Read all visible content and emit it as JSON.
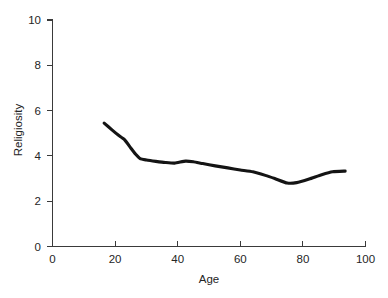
{
  "chart_data": {
    "type": "line",
    "title": "",
    "xlabel": "Age",
    "ylabel": "Religiosity",
    "xlim": [
      0,
      100
    ],
    "ylim": [
      0,
      10
    ],
    "xticks": [
      0,
      20,
      40,
      60,
      80,
      100
    ],
    "yticks": [
      0,
      2,
      4,
      6,
      8,
      10
    ],
    "xtick_labels": [
      "0",
      "20",
      "40",
      "60",
      "80",
      "100"
    ],
    "ytick_labels": [
      "0",
      "2",
      "4",
      "6",
      "8",
      "10"
    ],
    "grid": false,
    "legend": null,
    "series": [
      {
        "name": "Religiosity by age",
        "color": "#141414",
        "line_width": 3.1,
        "x": [
          16.5,
          19,
          21,
          23,
          25,
          26.5,
          28,
          30,
          33,
          36,
          39,
          42.5,
          45,
          48,
          52,
          56,
          60,
          64,
          68,
          71,
          75,
          78,
          82,
          86,
          89.5,
          93.5
        ],
        "y": [
          5.45,
          5.15,
          4.92,
          4.72,
          4.35,
          4.08,
          3.88,
          3.82,
          3.76,
          3.71,
          3.68,
          3.77,
          3.74,
          3.66,
          3.56,
          3.47,
          3.38,
          3.3,
          3.14,
          3.0,
          2.8,
          2.82,
          2.98,
          3.17,
          3.3,
          3.33
        ]
      }
    ]
  },
  "axes": {
    "x_axis_name": "Age",
    "y_axis_name": "Religiosity"
  },
  "colors": {
    "curve": "#141414",
    "axis": "#3a3a3a",
    "text": "#252525",
    "background": "#ffffff"
  }
}
